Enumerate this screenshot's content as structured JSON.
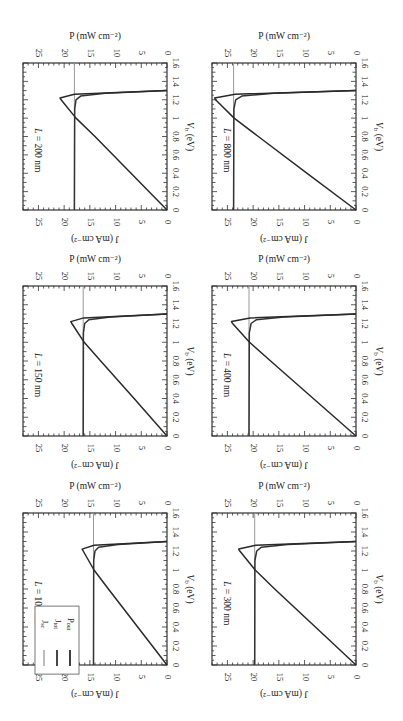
{
  "figure": {
    "layout": "3 rows x 2 columns of panels, printed rotated 90 degrees clockwise",
    "legend": {
      "panel": "L = 100 nm",
      "entries": [
        "J_sc",
        "J_tot",
        "P_out"
      ]
    }
  },
  "chart_data": [
    {
      "type": "line",
      "title": "L = 200 nm",
      "xlabel": "V_b (eV)",
      "ylabel_left": "J (mA cm^-2)",
      "ylabel_right": "P (mW cm^-2)",
      "xlim": [
        0,
        1.6
      ],
      "ylim": [
        0,
        28
      ],
      "xticks": [
        "0",
        "0.2",
        "0.4",
        "0.6",
        "0.8",
        "1",
        "1.2",
        "1.4",
        "1.6"
      ],
      "yticks_left": [
        "0",
        "5",
        "10",
        "15",
        "20",
        "25"
      ],
      "yticks_right": [
        "0",
        "5",
        "10",
        "15",
        "20",
        "25"
      ],
      "series": [
        {
          "name": "J_sc",
          "x": [
            0,
            1.6
          ],
          "y": [
            18.0,
            18.0
          ]
        },
        {
          "name": "J_tot",
          "x": [
            0,
            1.1,
            1.2,
            1.24,
            1.27,
            1.3
          ],
          "y": [
            18.0,
            17.95,
            17.7,
            16.8,
            12.0,
            0
          ]
        },
        {
          "name": "P_out",
          "x": [
            0,
            0.4,
            0.8,
            1.0,
            1.2,
            1.22,
            1.26,
            1.3
          ],
          "y": [
            0,
            7.0,
            14.0,
            17.7,
            20.6,
            20.8,
            18.0,
            0
          ]
        }
      ]
    },
    {
      "type": "line",
      "title": "L = 800 nm",
      "xlabel": "V_b (eV)",
      "ylabel_left": "J (mA cm^-2)",
      "ylabel_right": "P (mW cm^-2)",
      "xlim": [
        0,
        1.6
      ],
      "ylim": [
        0,
        28
      ],
      "xticks": [
        "0",
        "0.2",
        "0.4",
        "0.6",
        "0.8",
        "1",
        "1.2",
        "1.4",
        "1.6"
      ],
      "yticks_left": [
        "0",
        "5",
        "10",
        "15",
        "20",
        "25"
      ],
      "yticks_right": [
        "0",
        "5",
        "10",
        "15",
        "20",
        "25"
      ],
      "series": [
        {
          "name": "J_sc",
          "x": [
            0,
            1.6
          ],
          "y": [
            23.8,
            23.8
          ]
        },
        {
          "name": "J_tot",
          "x": [
            0,
            1.1,
            1.2,
            1.24,
            1.27,
            1.3
          ],
          "y": [
            23.8,
            23.75,
            23.4,
            22.2,
            16.0,
            0
          ]
        },
        {
          "name": "P_out",
          "x": [
            0,
            0.4,
            0.8,
            1.0,
            1.2,
            1.22,
            1.26,
            1.3
          ],
          "y": [
            0,
            9.5,
            19.0,
            23.7,
            27.3,
            27.5,
            23.5,
            0
          ]
        }
      ]
    },
    {
      "type": "line",
      "title": "L = 150 nm",
      "xlabel": "V_b (eV)",
      "ylabel_left": "J (mA cm^-2)",
      "ylabel_right": "P (mW cm^-2)",
      "xlim": [
        0,
        1.6
      ],
      "ylim": [
        0,
        28
      ],
      "xticks": [
        "0",
        "0.2",
        "0.4",
        "0.6",
        "0.8",
        "1",
        "1.2",
        "1.4",
        "1.6"
      ],
      "yticks_left": [
        "0",
        "5",
        "10",
        "15",
        "20",
        "25"
      ],
      "yticks_right": [
        "0",
        "5",
        "10",
        "15",
        "20",
        "25"
      ],
      "series": [
        {
          "name": "J_sc",
          "x": [
            0,
            1.6
          ],
          "y": [
            16.3,
            16.3
          ]
        },
        {
          "name": "J_tot",
          "x": [
            0,
            1.1,
            1.2,
            1.24,
            1.27,
            1.3
          ],
          "y": [
            16.3,
            16.25,
            16.0,
            15.2,
            11.0,
            0
          ]
        },
        {
          "name": "P_out",
          "x": [
            0,
            0.4,
            0.8,
            1.0,
            1.2,
            1.22,
            1.26,
            1.3
          ],
          "y": [
            0,
            6.4,
            12.9,
            16.1,
            18.5,
            18.7,
            16.2,
            0
          ]
        }
      ]
    },
    {
      "type": "line",
      "title": "L = 400 nm",
      "xlabel": "V_b (eV)",
      "ylabel_left": "J (mA cm^-2)",
      "ylabel_right": "P (mW cm^-2)",
      "xlim": [
        0,
        1.6
      ],
      "ylim": [
        0,
        28
      ],
      "xticks": [
        "0",
        "0.2",
        "0.4",
        "0.6",
        "0.8",
        "1",
        "1.2",
        "1.4",
        "1.6"
      ],
      "yticks_left": [
        "0",
        "5",
        "10",
        "15",
        "20",
        "25"
      ],
      "yticks_right": [
        "0",
        "5",
        "10",
        "15",
        "20",
        "25"
      ],
      "series": [
        {
          "name": "J_sc",
          "x": [
            0,
            1.6
          ],
          "y": [
            20.8,
            20.8
          ]
        },
        {
          "name": "J_tot",
          "x": [
            0,
            1.1,
            1.2,
            1.24,
            1.27,
            1.3
          ],
          "y": [
            20.8,
            20.75,
            20.4,
            19.4,
            14.0,
            0
          ]
        },
        {
          "name": "P_out",
          "x": [
            0,
            0.4,
            0.8,
            1.0,
            1.2,
            1.22,
            1.26,
            1.3
          ],
          "y": [
            0,
            8.3,
            16.6,
            20.7,
            24.0,
            24.2,
            20.6,
            0
          ]
        }
      ]
    },
    {
      "type": "line",
      "title": "L = 100 nm",
      "xlabel": "V_b (eV)",
      "ylabel_left": "J (mA cm^-2)",
      "ylabel_right": "P (mW cm^-2)",
      "xlim": [
        0,
        1.6
      ],
      "ylim": [
        0,
        28
      ],
      "xticks": [
        "0",
        "0.2",
        "0.4",
        "0.6",
        "0.8",
        "1",
        "1.2",
        "1.4",
        "1.6"
      ],
      "yticks_left": [
        "0",
        "5",
        "10",
        "15",
        "20",
        "25"
      ],
      "yticks_right": [
        "0",
        "5",
        "10",
        "15",
        "20",
        "25"
      ],
      "legend": [
        "J_sc",
        "J_tot",
        "P_out"
      ],
      "series": [
        {
          "name": "J_sc",
          "x": [
            0,
            1.6
          ],
          "y": [
            14.3,
            14.3
          ]
        },
        {
          "name": "J_tot",
          "x": [
            0,
            1.1,
            1.2,
            1.24,
            1.27,
            1.3
          ],
          "y": [
            14.3,
            14.25,
            14.0,
            13.3,
            9.5,
            0
          ]
        },
        {
          "name": "P_out",
          "x": [
            0,
            0.4,
            0.8,
            1.0,
            1.2,
            1.22,
            1.26,
            1.3
          ],
          "y": [
            0,
            5.7,
            11.4,
            14.2,
            16.3,
            16.5,
            14.2,
            0
          ]
        }
      ]
    },
    {
      "type": "line",
      "title": "L = 300 nm",
      "xlabel": "V_b (eV)",
      "ylabel_left": "J (mA cm^-2)",
      "ylabel_right": "P (mW cm^-2)",
      "xlim": [
        0,
        1.6
      ],
      "ylim": [
        0,
        28
      ],
      "xticks": [
        "0",
        "0.2",
        "0.4",
        "0.6",
        "0.8",
        "1",
        "1.2",
        "1.4",
        "1.6"
      ],
      "yticks_left": [
        "0",
        "5",
        "10",
        "15",
        "20",
        "25"
      ],
      "yticks_right": [
        "0",
        "5",
        "10",
        "15",
        "20",
        "25"
      ],
      "series": [
        {
          "name": "J_sc",
          "x": [
            0,
            1.6
          ],
          "y": [
            19.7,
            19.7
          ]
        },
        {
          "name": "J_tot",
          "x": [
            0,
            1.1,
            1.2,
            1.24,
            1.27,
            1.3
          ],
          "y": [
            19.7,
            19.65,
            19.3,
            18.4,
            13.3,
            0
          ]
        },
        {
          "name": "P_out",
          "x": [
            0,
            0.4,
            0.8,
            1.0,
            1.2,
            1.22,
            1.26,
            1.3
          ],
          "y": [
            0,
            7.9,
            15.8,
            19.6,
            22.6,
            22.8,
            19.5,
            0
          ]
        }
      ]
    }
  ]
}
